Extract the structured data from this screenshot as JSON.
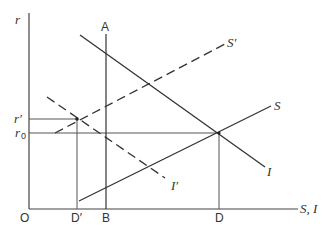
{
  "diagram": {
    "type": "economics-supply-demand",
    "axes": {
      "y_label": "r",
      "x_label": "S, I",
      "origin_label": "O"
    },
    "y_ticks": [
      {
        "label": "r′",
        "y": 119
      },
      {
        "label": "r0_base",
        "text": "r",
        "sub": "0",
        "y": 133
      }
    ],
    "x_ticks": [
      {
        "label": "D′",
        "x": 77
      },
      {
        "label": "B",
        "x": 106
      },
      {
        "label": "D",
        "x": 219
      }
    ],
    "curves": [
      {
        "name": "S",
        "style": "solid",
        "label": "S"
      },
      {
        "name": "S'",
        "style": "dashed",
        "label": "S′"
      },
      {
        "name": "I",
        "style": "solid",
        "label": "I"
      },
      {
        "name": "I'",
        "style": "dashed",
        "label": "I′"
      },
      {
        "name": "AB",
        "style": "solid",
        "label_top": "A",
        "label_bottom": "B"
      }
    ],
    "labels": {
      "r": "r",
      "r_prime": "r′",
      "r0_r": "r",
      "r0_sub": "0",
      "A": "A",
      "O": "O",
      "D_prime": "D′",
      "B": "B",
      "D": "D",
      "S_I": "S, I",
      "S": "S",
      "S_prime": "S′",
      "I": "I",
      "I_prime": "I′"
    }
  }
}
